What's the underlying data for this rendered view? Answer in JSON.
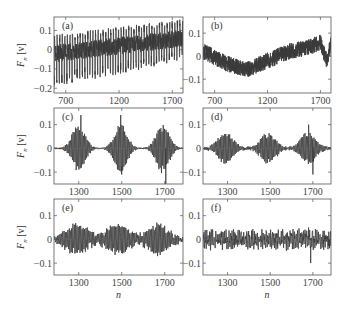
{
  "chart_data": [
    {
      "id": "a",
      "panel_label": "(a)",
      "type": "line",
      "ylabel": "F_n [v]",
      "xlabel": "",
      "xlim": [
        590,
        1800
      ],
      "ylim": [
        -0.225,
        0.17
      ],
      "xticks": [
        700,
        1200,
        1700
      ],
      "xtick_labels": [
        "700",
        "1200",
        "1700"
      ],
      "yticks": [
        0.1,
        0,
        -0.1,
        -0.2
      ],
      "ytick_labels": [
        "0.1",
        "0",
        "−0.1",
        "−0.2"
      ],
      "signal": {
        "kind": "spiky",
        "baseline_start": -0.02,
        "baseline_end": 0.06,
        "amp_up": 0.09,
        "amp_down": 0.18,
        "period": 24,
        "noise": 0.03
      }
    },
    {
      "id": "b",
      "panel_label": "(b)",
      "type": "line",
      "ylabel": "",
      "xlabel": "",
      "xlim": [
        590,
        1800
      ],
      "ylim": [
        -0.16,
        0.17
      ],
      "xticks": [
        700,
        1200,
        1700
      ],
      "xtick_labels": [
        "700",
        "1200",
        "1700"
      ],
      "yticks": [
        0.1,
        0,
        -0.1
      ],
      "ytick_labels": [
        "0.1",
        "0",
        "−0.1"
      ],
      "signal": {
        "kind": "drift",
        "trend": [
          [
            600,
            0.02
          ],
          [
            800,
            -0.03
          ],
          [
            1000,
            -0.06
          ],
          [
            1200,
            -0.02
          ],
          [
            1400,
            0.02
          ],
          [
            1600,
            0.04
          ],
          [
            1700,
            0.06
          ],
          [
            1760,
            -0.02
          ],
          [
            1800,
            0.05
          ]
        ],
        "noise": 0.035
      }
    },
    {
      "id": "c",
      "panel_label": "(c)",
      "type": "line",
      "ylabel": "F_n [v]",
      "xlabel": "",
      "xlim": [
        1185,
        1785
      ],
      "ylim": [
        -0.15,
        0.17
      ],
      "xticks": [
        1300,
        1500,
        1700
      ],
      "xtick_labels": [
        "1300",
        "1500",
        "1700"
      ],
      "yticks": [
        0.1,
        0,
        -0.1
      ],
      "ytick_labels": [
        "0.1",
        "0",
        "−0.1"
      ],
      "signal": {
        "kind": "bursts",
        "centers": [
          1300,
          1495,
          1690
        ],
        "width": 42,
        "amp": 0.1,
        "carrier_period": 6,
        "floor": 0.003,
        "spikes": [
          [
            1310,
            0.14
          ],
          [
            1495,
            0.14
          ],
          [
            1500,
            -0.11
          ],
          [
            1705,
            -0.15
          ]
        ]
      }
    },
    {
      "id": "d",
      "panel_label": "(d)",
      "type": "line",
      "ylabel": "",
      "xlabel": "",
      "xlim": [
        1185,
        1785
      ],
      "ylim": [
        -0.15,
        0.17
      ],
      "xticks": [
        1300,
        1500,
        1700
      ],
      "xtick_labels": [
        "1300",
        "1500",
        "1700"
      ],
      "yticks": [
        0.1,
        0,
        -0.1
      ],
      "ytick_labels": [
        "0.1",
        "0",
        "−0.1"
      ],
      "signal": {
        "kind": "bursts",
        "centers": [
          1290,
          1490,
          1680
        ],
        "width": 50,
        "amp": 0.065,
        "carrier_period": 6,
        "floor": 0.006,
        "spikes": [
          [
            1700,
            -0.11
          ],
          [
            1680,
            0.1
          ]
        ]
      }
    },
    {
      "id": "e",
      "panel_label": "(e)",
      "type": "line",
      "ylabel": "F_n [v]",
      "xlabel": "n",
      "xlim": [
        1185,
        1785
      ],
      "ylim": [
        -0.15,
        0.17
      ],
      "xticks": [
        1300,
        1500,
        1700
      ],
      "xtick_labels": [
        "1300",
        "1500",
        "1700"
      ],
      "yticks": [
        0.1,
        0,
        -0.1
      ],
      "ytick_labels": [
        "0.1",
        "0",
        "−0.1"
      ],
      "signal": {
        "kind": "bursts",
        "centers": [
          1290,
          1480,
          1670
        ],
        "width": 70,
        "amp": 0.06,
        "carrier_period": 6,
        "floor": 0.012,
        "spikes": []
      }
    },
    {
      "id": "f",
      "panel_label": "(f)",
      "type": "line",
      "ylabel": "",
      "xlabel": "n",
      "xlim": [
        1185,
        1785
      ],
      "ylim": [
        -0.15,
        0.17
      ],
      "xticks": [
        1300,
        1500,
        1700
      ],
      "xtick_labels": [
        "1300",
        "1500",
        "1700"
      ],
      "yticks": [
        0.1,
        0,
        -0.1
      ],
      "ytick_labels": [
        "0.1",
        "0",
        "−0.1"
      ],
      "signal": {
        "kind": "noise",
        "amp": 0.03,
        "spikes": [
          [
            1690,
            -0.1
          ],
          [
            1680,
            0.05
          ],
          [
            1350,
            0.04
          ]
        ]
      }
    }
  ],
  "layout": {
    "panels": [
      {
        "x": 54,
        "y": 17,
        "w": 129,
        "h": 76
      },
      {
        "x": 203,
        "y": 17,
        "w": 128,
        "h": 76
      },
      {
        "x": 54,
        "y": 108,
        "w": 129,
        "h": 76
      },
      {
        "x": 203,
        "y": 108,
        "w": 128,
        "h": 76
      },
      {
        "x": 54,
        "y": 199,
        "w": 129,
        "h": 76
      },
      {
        "x": 203,
        "y": 199,
        "w": 128,
        "h": 76
      }
    ],
    "line_color": "#3a3a3a",
    "axis_color": "#555555"
  }
}
